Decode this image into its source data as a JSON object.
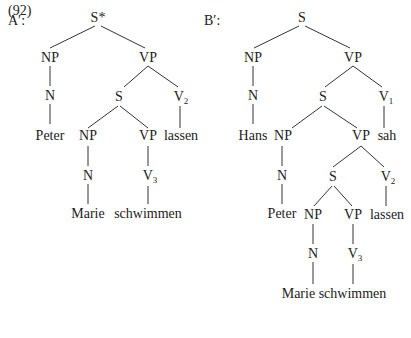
{
  "example_number": "(92)",
  "trees": {
    "a": {
      "label": "A′:",
      "root": "S*",
      "np": "NP",
      "vp": "VP",
      "n": "N",
      "peter": "Peter",
      "s": "S",
      "v2": "V",
      "v2_sub": "2",
      "lassen": "lassen",
      "np2": "NP",
      "vp2": "VP",
      "n2": "N",
      "marie": "Marie",
      "v3": "V",
      "v3_sub": "3",
      "schwimmen": "schwimmen"
    },
    "b": {
      "label": "B′:",
      "root": "S",
      "np": "NP",
      "vp": "VP",
      "n": "N",
      "hans": "Hans",
      "s": "S",
      "v1": "V",
      "v1_sub": "1",
      "sah": "sah",
      "np2": "NP",
      "vp2": "VP",
      "n2": "N",
      "peter": "Peter",
      "s2": "S",
      "v2": "V",
      "v2_sub": "2",
      "lassen": "lassen",
      "np3": "NP",
      "vp3": "VP",
      "n3": "N",
      "v3": "V",
      "v3_sub": "3",
      "marie_schwimmen": "Marie schwimmen"
    }
  }
}
